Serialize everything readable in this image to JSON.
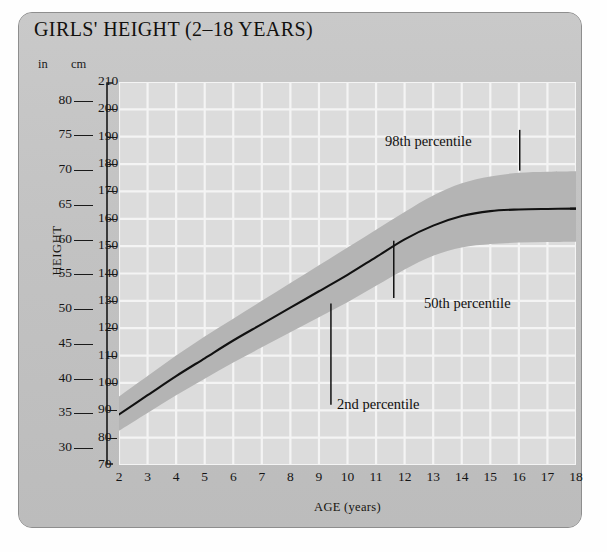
{
  "card": {
    "title": "GIRLS' HEIGHT (2–18 YEARS)",
    "background_color": "#c3c3c3",
    "border_color": "#8e8e8e"
  },
  "axes": {
    "y_axis_label": "HEIGHT",
    "y_unit_primary": "in",
    "y_unit_secondary": "cm",
    "x_axis_label": "AGE (years)",
    "cm_ticks": [
      210,
      200,
      190,
      180,
      170,
      160,
      150,
      140,
      130,
      120,
      110,
      100,
      90,
      80,
      70
    ],
    "in_ticks": [
      80,
      75,
      70,
      65,
      60,
      55,
      50,
      45,
      40,
      35,
      30
    ],
    "age_ticks": [
      2,
      3,
      4,
      5,
      6,
      7,
      8,
      9,
      10,
      11,
      12,
      13,
      14,
      15,
      16,
      17,
      18
    ]
  },
  "annotations": [
    {
      "name": "98th-percentile",
      "label": "98th percentile"
    },
    {
      "name": "50th-percentile",
      "label": "50th percentile"
    },
    {
      "name": "2nd-percentile",
      "label": "2nd percentile"
    }
  ],
  "colors": {
    "plot_background": "#dcdcdc",
    "gridline": "#f4f4f4",
    "band_fill": "#b4b4b4",
    "median_line": "#111111",
    "text": "#151515"
  },
  "chart_data": {
    "type": "line",
    "title": "GIRLS' HEIGHT (2–18 YEARS)",
    "xlabel": "AGE (years)",
    "ylabel": "HEIGHT",
    "xlim": [
      2,
      18
    ],
    "ylim": [
      70,
      210
    ],
    "y_unit": "cm",
    "y_secondary_unit": "in",
    "y_secondary_lim": [
      27.6,
      82.7
    ],
    "grid": true,
    "legend": "inline-annotations",
    "x": [
      2,
      3,
      4,
      5,
      6,
      7,
      8,
      9,
      10,
      11,
      12,
      13,
      14,
      15,
      16,
      17,
      18
    ],
    "series": [
      {
        "name": "98th percentile",
        "role": "band-upper",
        "values": [
          95.0,
          102.5,
          110.0,
          117.0,
          123.5,
          130.0,
          136.5,
          143.0,
          149.5,
          156.0,
          162.5,
          168.5,
          173.0,
          175.5,
          176.8,
          177.2,
          177.4
        ]
      },
      {
        "name": "50th percentile",
        "role": "median-line",
        "values": [
          88.5,
          95.5,
          102.5,
          109.0,
          115.5,
          121.5,
          127.5,
          133.5,
          139.5,
          146.0,
          152.5,
          157.5,
          161.0,
          162.8,
          163.4,
          163.6,
          163.7
        ]
      },
      {
        "name": "2nd percentile",
        "role": "band-lower",
        "values": [
          82.5,
          89.0,
          95.5,
          101.5,
          107.5,
          113.0,
          118.5,
          124.0,
          129.5,
          135.5,
          141.5,
          146.5,
          149.5,
          150.8,
          151.3,
          151.5,
          151.6
        ]
      }
    ]
  }
}
